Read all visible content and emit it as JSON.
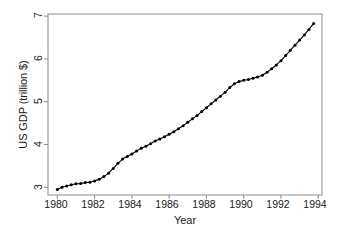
{
  "chart_data": {
    "type": "line",
    "title": "",
    "xlabel": "Year",
    "ylabel": "US GDP (trillion $)",
    "xlim": [
      1979.5,
      1994.2
    ],
    "ylim": [
      2.82,
      7.05
    ],
    "xticks": [
      1980,
      1982,
      1984,
      1986,
      1988,
      1990,
      1992,
      1994
    ],
    "xtick_labels": [
      "1980",
      "1982",
      "1984",
      "1986",
      "1988",
      "1990",
      "1992",
      "1994"
    ],
    "yticks": [
      3,
      4,
      5,
      6,
      7
    ],
    "ytick_labels": [
      "3",
      "4",
      "5",
      "6",
      "7"
    ],
    "grid": false,
    "legend": null,
    "marker": "filled-circle",
    "line_color": "#000000",
    "marker_color": "#000000",
    "frame_color": "#8c8c8c",
    "background_color": "#ffffff",
    "series": [
      {
        "name": "US GDP",
        "units": "trillion $",
        "frequency": "quarterly",
        "x": [
          1980.0,
          1980.25,
          1980.5,
          1980.75,
          1981.0,
          1981.25,
          1981.5,
          1981.75,
          1982.0,
          1982.25,
          1982.5,
          1982.75,
          1983.0,
          1983.25,
          1983.5,
          1983.75,
          1984.0,
          1984.25,
          1984.5,
          1984.75,
          1985.0,
          1985.25,
          1985.5,
          1985.75,
          1986.0,
          1986.25,
          1986.5,
          1986.75,
          1987.0,
          1987.25,
          1987.5,
          1987.75,
          1988.0,
          1988.25,
          1988.5,
          1988.75,
          1989.0,
          1989.25,
          1989.5,
          1989.75,
          1990.0,
          1990.25,
          1990.5,
          1990.75,
          1991.0,
          1991.25,
          1991.5,
          1991.75,
          1992.0,
          1992.25,
          1992.5,
          1992.75,
          1993.0,
          1993.25,
          1993.5,
          1993.75
        ],
        "values": [
          2.95,
          3.0,
          3.03,
          3.06,
          3.08,
          3.09,
          3.11,
          3.12,
          3.15,
          3.19,
          3.25,
          3.33,
          3.44,
          3.56,
          3.66,
          3.72,
          3.78,
          3.85,
          3.91,
          3.96,
          4.02,
          4.08,
          4.13,
          4.18,
          4.24,
          4.3,
          4.37,
          4.44,
          4.52,
          4.6,
          4.68,
          4.77,
          4.86,
          4.95,
          5.04,
          5.13,
          5.22,
          5.33,
          5.42,
          5.47,
          5.5,
          5.52,
          5.55,
          5.58,
          5.62,
          5.69,
          5.77,
          5.86,
          5.96,
          6.08,
          6.2,
          6.32,
          6.44,
          6.56,
          6.69,
          6.83
        ]
      }
    ]
  },
  "axes": {
    "x_axis_name": "Year",
    "y_axis_name": "US GDP (trillion $)"
  }
}
